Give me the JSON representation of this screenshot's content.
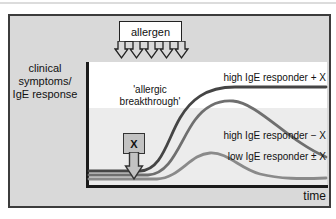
{
  "figure": {
    "allergen_box": {
      "label": "allergen"
    },
    "y_axis": {
      "label": "clinical\nsymptoms/\nIgE response"
    },
    "x_axis": {
      "label": "time"
    },
    "breakthrough_note": {
      "text": "'allergic\nbreakthrough'"
    },
    "x_factor_box": {
      "label": "X"
    },
    "curves": [
      {
        "id": "high-ige-responder-plus-x",
        "label": "high IgE responder + X",
        "color": "#454545",
        "shape": "rises steeply then plateaus at high level"
      },
      {
        "id": "high-ige-responder-minus-x",
        "label": "high IgE responder − X",
        "color": "#6f6f6f",
        "shape": "rises, peaks, then partially declines"
      },
      {
        "id": "low-ige-responder-plus-minus-x",
        "label": "low IgE responder ± X",
        "color": "#8a8a8a",
        "shape": "small transient bump, returns near baseline"
      }
    ],
    "colors": {
      "panel_bg": "#d9d9d9",
      "plot_upper_bg": "#ffffff",
      "plot_lower_bg": "#ececec",
      "axis": "#1a1a1a",
      "allergen_box_bg": "#ffffff",
      "x_box_bg": "#c2c2c2",
      "outline": "#222222"
    }
  }
}
